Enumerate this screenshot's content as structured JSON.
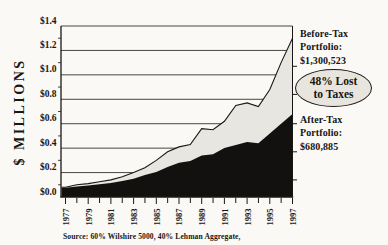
{
  "chart_data": {
    "type": "area",
    "title": "",
    "ylabel": "$ MILLIONS",
    "xlabel": "",
    "ylim": [
      0,
      1.4
    ],
    "grid": true,
    "legend_position": "right-annotations",
    "y_ticks": {
      "labels": [
        "$1.4",
        "$1.2",
        "$1.0",
        "$0.8",
        "$0.6",
        "$0.4",
        "$0.2",
        "$0.0"
      ],
      "values": [
        1.4,
        1.2,
        1.0,
        0.8,
        0.6,
        0.4,
        0.2,
        0.0
      ]
    },
    "left_minor_tick_values": [
      0.1,
      0.3,
      0.5,
      0.7,
      0.9,
      1.1,
      1.3
    ],
    "right_tick_values": [
      0.14,
      0.37,
      0.6,
      0.84,
      1.07
    ],
    "years": [
      1977,
      1978,
      1979,
      1980,
      1981,
      1982,
      1983,
      1984,
      1985,
      1986,
      1987,
      1988,
      1989,
      1990,
      1991,
      1992,
      1993,
      1994,
      1995,
      1996,
      1997
    ],
    "x_label_years": [
      "1977",
      "1979",
      "1981",
      "1983",
      "1985",
      "1987",
      "1989",
      "1991",
      "1993",
      "1995",
      "1997"
    ],
    "series": [
      {
        "name": "Before-Tax Portfolio",
        "final_value": "$1,300,523",
        "color": "#e8e6e1",
        "values": [
          0.08,
          0.1,
          0.11,
          0.125,
          0.14,
          0.165,
          0.2,
          0.24,
          0.3,
          0.37,
          0.41,
          0.43,
          0.56,
          0.55,
          0.62,
          0.75,
          0.77,
          0.74,
          0.88,
          1.1,
          1.3
        ]
      },
      {
        "name": "After-Tax Portfolio",
        "final_value": "$680,885",
        "color": "#131110",
        "values": [
          0.075,
          0.085,
          0.095,
          0.105,
          0.115,
          0.13,
          0.15,
          0.18,
          0.205,
          0.245,
          0.28,
          0.295,
          0.34,
          0.35,
          0.4,
          0.425,
          0.45,
          0.44,
          0.52,
          0.6,
          0.68
        ]
      }
    ],
    "colors": {
      "background": "#faf9f6",
      "grid": "#35322e",
      "line": "#1a1815",
      "text": "#181512",
      "area_light": "#e8e6e1",
      "area_dark": "#131110",
      "callout_fill": "#e7e5de"
    }
  },
  "annotations": {
    "before_tax": {
      "lines": [
        "Before-Tax",
        "Portfolio:",
        "$1,300,523"
      ]
    },
    "tax_callout": {
      "lines": [
        "48% Lost",
        "to Taxes"
      ]
    },
    "after_tax": {
      "lines": [
        "After-Tax",
        "Portfolio:",
        "$680,885"
      ]
    }
  },
  "footer": {
    "source": "Source: 60% Wilshire 5000, 40% Lehman Aggregate,"
  }
}
